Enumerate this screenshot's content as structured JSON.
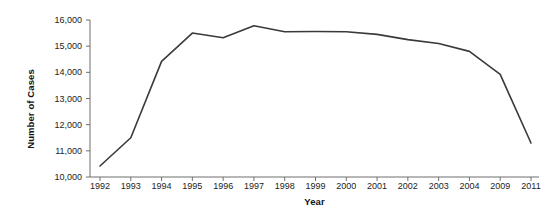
{
  "chart_data": {
    "type": "line",
    "title": "",
    "subtitle": "",
    "xlabel": "Year",
    "ylabel": "Number of Cases",
    "categories": [
      "1992",
      "1993",
      "1994",
      "1995",
      "1996",
      "1997",
      "1998",
      "1999",
      "2000",
      "2001",
      "2002",
      "2003",
      "2004",
      "2009",
      "2011"
    ],
    "values": [
      10420,
      11500,
      14420,
      15500,
      15320,
      15780,
      15550,
      15560,
      15550,
      15450,
      15250,
      15100,
      14800,
      13920,
      11300
    ],
    "series": [
      {
        "name": "Number of Cases",
        "values": [
          10420,
          11500,
          14420,
          15500,
          15320,
          15780,
          15550,
          15560,
          15550,
          15450,
          15250,
          15100,
          14800,
          13920,
          11300
        ]
      }
    ],
    "ylim": [
      10000,
      16000
    ],
    "ytick_values": [
      10000,
      11000,
      12000,
      13000,
      14000,
      15000,
      16000
    ],
    "ytick_labels": [
      "10,000",
      "11,000",
      "12,000",
      "13,000",
      "14,000",
      "15,000",
      "16,000"
    ],
    "grid": false,
    "legend": false,
    "legend_position": "none",
    "line_color": "#3a3a3a",
    "axis_color": "#6f6f6f",
    "background_color": "#ffffff",
    "text_color": "#232323"
  }
}
